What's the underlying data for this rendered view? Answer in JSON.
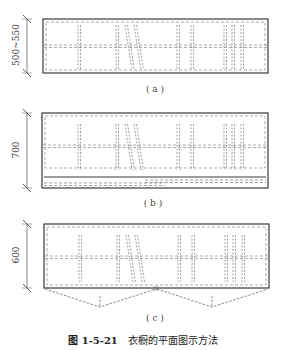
{
  "figure": {
    "caption_number": "图 1-5-21",
    "caption_title": "衣橱的平面图示方法",
    "colors": {
      "outline": "#3a3a3a",
      "dashed": "#8a8a8a",
      "text": "#444444"
    }
  },
  "panels": [
    {
      "id": "a",
      "label": "( a )",
      "dimension": "500~550",
      "door_type": "none"
    },
    {
      "id": "b",
      "label": "( b )",
      "dimension": "700",
      "door_type": "sliding"
    },
    {
      "id": "c",
      "label": "( c )",
      "dimension": "600",
      "door_type": "hinged"
    }
  ]
}
